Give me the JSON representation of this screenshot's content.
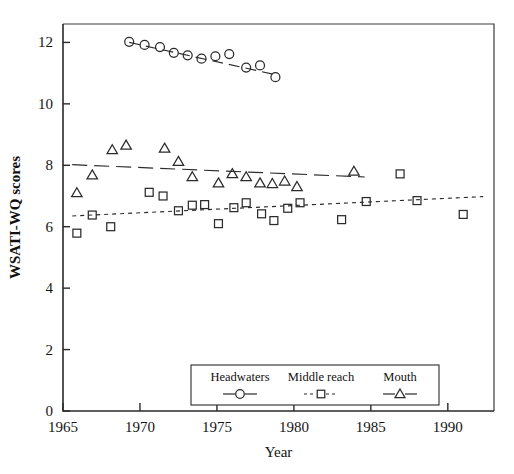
{
  "chart_data": {
    "type": "scatter",
    "title": "",
    "xlabel": "Year",
    "ylabel": "WSATI-WQ scores",
    "xlim": [
      1965,
      1993
    ],
    "ylim": [
      0,
      12.6
    ],
    "xticks": [
      1965,
      1970,
      1975,
      1980,
      1985,
      1990
    ],
    "yticks": [
      0,
      2,
      4,
      6,
      8,
      10,
      12
    ],
    "xtick_labels": [
      "1965",
      "1970",
      "1975",
      "1980",
      "1985",
      "1990"
    ],
    "ytick_labels": [
      "0",
      "2",
      "4",
      "6",
      "8",
      "10",
      "12"
    ],
    "grid": false,
    "legend_position": "bottom-center-inside",
    "series": [
      {
        "name": "Headwaters",
        "marker": "circle",
        "line_style": "long-dash",
        "x": [
          1969.3,
          1970.3,
          1971.3,
          1972.2,
          1973.1,
          1974.0,
          1974.9,
          1975.8,
          1976.9,
          1977.8,
          1978.8
        ],
        "y": [
          12.02,
          11.92,
          11.85,
          11.66,
          11.58,
          11.47,
          11.55,
          11.62,
          11.18,
          11.25,
          10.87
        ],
        "trend": {
          "x": [
            1969.3,
            1978.8
          ],
          "y": [
            12.0,
            10.95
          ]
        }
      },
      {
        "name": "Middle reach",
        "marker": "square",
        "line_style": "dotted",
        "x": [
          1965.9,
          1966.9,
          1968.1,
          1970.6,
          1971.5,
          1972.5,
          1973.4,
          1974.2,
          1975.1,
          1976.1,
          1976.9,
          1977.9,
          1978.7,
          1979.6,
          1980.4,
          1983.1,
          1984.7,
          1986.9,
          1988.0,
          1991.0
        ],
        "y": [
          5.79,
          6.38,
          6.0,
          7.12,
          7.0,
          6.52,
          6.7,
          6.72,
          6.1,
          6.62,
          6.78,
          6.42,
          6.2,
          6.6,
          6.78,
          6.23,
          6.82,
          7.72,
          6.85,
          6.4
        ],
        "trend": {
          "x": [
            1965.6,
            1992.3
          ],
          "y": [
            6.35,
            6.98
          ]
        }
      },
      {
        "name": "Mouth",
        "marker": "triangle",
        "line_style": "dash",
        "x": [
          1965.9,
          1966.9,
          1968.2,
          1969.1,
          1971.6,
          1972.5,
          1973.4,
          1975.1,
          1976.0,
          1976.9,
          1977.8,
          1978.6,
          1979.4,
          1980.2,
          1983.9
        ],
        "y": [
          7.1,
          7.68,
          8.5,
          8.65,
          8.55,
          8.12,
          7.62,
          7.42,
          7.72,
          7.62,
          7.42,
          7.4,
          7.48,
          7.3,
          7.8
        ],
        "trend": {
          "x": [
            1965.6,
            1984.6
          ],
          "y": [
            8.02,
            7.62
          ]
        }
      }
    ]
  },
  "legend": {
    "entries": [
      {
        "label": "Headwaters",
        "marker": "circle"
      },
      {
        "label": "Middle reach",
        "marker": "square"
      },
      {
        "label": "Mouth",
        "marker": "triangle"
      }
    ]
  },
  "caption": {
    "fragment": ""
  }
}
